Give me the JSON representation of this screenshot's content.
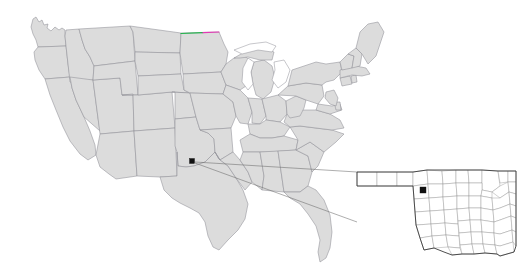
{
  "map": {
    "type": "locator-map",
    "title": "United States locator map with Oklahoma county inset",
    "projection": "albers-usa",
    "background_color": "#ffffff",
    "state_fill_color": "#dcdcdc",
    "state_border_color": "#8f8f96",
    "inset_fill_color": "#ffffff",
    "inset_border_color": "#8a8a8a",
    "inset_outline_color": "#3a3a3a",
    "marker_color": "#111111",
    "leader_line_color": "#6b6b6b",
    "highlight_green_color": "#21b24b",
    "highlight_magenta_color": "#e23ab4"
  },
  "main_map": {
    "name": "united-states",
    "marker": {
      "label": "location-marker",
      "shape": "square",
      "x": 192,
      "y": 161,
      "size": 5
    },
    "highlighted_border": {
      "label": "north-dakota-minnesota-border-highlight",
      "green_segment": {
        "x1": 181,
        "y1": 33.5,
        "x2": 203,
        "y2": 32.6
      },
      "magenta_segment": {
        "x1": 203,
        "y1": 32.6,
        "x2": 219,
        "y2": 32.0
      }
    }
  },
  "inset_map": {
    "name": "oklahoma-counties",
    "marker": {
      "label": "highlighted-county-marker",
      "shape": "square",
      "x": 423,
      "y": 190,
      "size": 6
    },
    "frame": {
      "x": 356,
      "y": 158,
      "width": 160,
      "height": 100
    }
  },
  "leader_lines": [
    {
      "label": "leader-line-upper",
      "x1": 195,
      "y1": 162,
      "x2": 357,
      "y2": 172
    },
    {
      "label": "leader-line-lower",
      "x1": 195,
      "y1": 163,
      "x2": 357,
      "y2": 222
    }
  ]
}
